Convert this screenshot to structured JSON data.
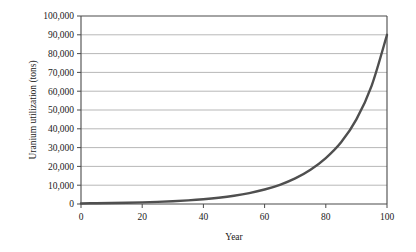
{
  "chart_data": {
    "type": "line",
    "title": "",
    "xlabel": "Year",
    "ylabel": "Uranium utilization (tons)",
    "xlim": [
      0,
      100
    ],
    "ylim": [
      0,
      100000
    ],
    "grid": "horizontal",
    "legend": "none",
    "xticks": [
      "0",
      "20",
      "40",
      "60",
      "80",
      "100"
    ],
    "xtick_values": [
      0,
      20,
      40,
      60,
      80,
      100
    ],
    "yticks": [
      "0",
      "10,000",
      "20,000",
      "30,000",
      "40,000",
      "50,000",
      "60,000",
      "70,000",
      "80,000",
      "90,000",
      "100,000"
    ],
    "ytick_values": [
      0,
      10000,
      20000,
      30000,
      40000,
      50000,
      60000,
      70000,
      80000,
      90000,
      100000
    ],
    "series": [
      {
        "name": "Uranium utilization",
        "color": "#4f4f4f",
        "x": [
          0,
          5,
          10,
          15,
          20,
          25,
          30,
          35,
          40,
          45,
          50,
          55,
          60,
          65,
          70,
          75,
          80,
          85,
          90,
          95,
          100
        ],
        "values": [
          300,
          400,
          520,
          680,
          880,
          1150,
          1500,
          1950,
          2550,
          3350,
          4400,
          5800,
          7700,
          10200,
          13600,
          18200,
          24400,
          32800,
          45000,
          63000,
          90000
        ]
      }
    ]
  },
  "axis": {
    "y_title": "Uranium utilization (tons)",
    "x_title": "Year"
  }
}
